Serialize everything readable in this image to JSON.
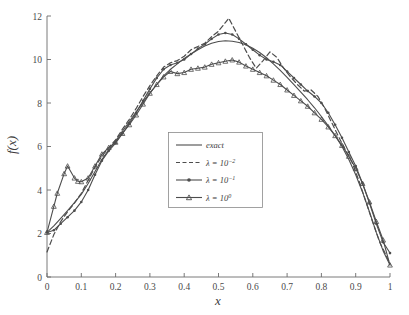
{
  "figure": {
    "background": "#ffffff",
    "axis_color": "#6b6b6b",
    "curve_color": "#4d4d4d"
  },
  "chart_data": {
    "type": "line",
    "title": "",
    "xlabel": "x",
    "ylabel": "f(x)",
    "xlim": [
      0,
      1
    ],
    "ylim": [
      0,
      12
    ],
    "grid": false,
    "legend_position": "center",
    "xticks": [
      "0",
      "0.1",
      "0.2",
      "0.3",
      "0.4",
      "0.5",
      "0.6",
      "0.7",
      "0.8",
      "0.9",
      "1"
    ],
    "xtick_values": [
      0,
      0.1,
      0.2,
      0.3,
      0.4,
      0.5,
      0.6,
      0.7,
      0.8,
      0.9,
      1
    ],
    "yticks": [
      "0",
      "2",
      "4",
      "6",
      "8",
      "10",
      "12"
    ],
    "ytick_values": [
      0,
      2,
      4,
      6,
      8,
      10,
      12
    ],
    "legend": [
      {
        "label": "exact",
        "style": "solid",
        "marker": "none"
      },
      {
        "label": "λ = 10",
        "exponent": "−2",
        "style": "dashed",
        "marker": "none"
      },
      {
        "label": "λ = 10",
        "exponent": "−1",
        "style": "solid",
        "marker": "dot"
      },
      {
        "label": "λ = 10",
        "exponent": "0",
        "style": "solid",
        "marker": "triangle"
      }
    ],
    "series": [
      {
        "name": "exact",
        "style": "solid",
        "marker": "none",
        "x": [
          0.0,
          0.02,
          0.04,
          0.06,
          0.08,
          0.1,
          0.12,
          0.14,
          0.16,
          0.18,
          0.2,
          0.22,
          0.24,
          0.26,
          0.28,
          0.3,
          0.32,
          0.34,
          0.36,
          0.38,
          0.4,
          0.42,
          0.44,
          0.46,
          0.48,
          0.5,
          0.52,
          0.54,
          0.56,
          0.58,
          0.6,
          0.62,
          0.64,
          0.66,
          0.68,
          0.7,
          0.72,
          0.74,
          0.76,
          0.78,
          0.8,
          0.82,
          0.84,
          0.86,
          0.88,
          0.9,
          0.92,
          0.94,
          0.96,
          0.98,
          1.0
        ],
        "y": [
          2.05,
          2.35,
          2.7,
          3.05,
          3.42,
          3.8,
          4.3,
          4.85,
          5.4,
          5.85,
          6.25,
          6.7,
          7.15,
          7.6,
          8.05,
          8.45,
          8.85,
          9.25,
          9.55,
          9.8,
          10.05,
          10.25,
          10.45,
          10.62,
          10.75,
          10.83,
          10.86,
          10.84,
          10.78,
          10.68,
          10.52,
          10.32,
          10.08,
          9.8,
          9.5,
          9.18,
          8.85,
          8.5,
          8.15,
          7.78,
          7.38,
          6.95,
          6.5,
          6.0,
          5.4,
          4.7,
          3.9,
          3.0,
          2.05,
          1.2,
          0.55
        ]
      },
      {
        "name": "lambda_1e-2",
        "style": "dashed",
        "marker": "none",
        "x": [
          0.0,
          0.02,
          0.04,
          0.06,
          0.08,
          0.1,
          0.12,
          0.14,
          0.16,
          0.18,
          0.2,
          0.22,
          0.24,
          0.26,
          0.28,
          0.3,
          0.32,
          0.34,
          0.36,
          0.38,
          0.4,
          0.42,
          0.44,
          0.46,
          0.48,
          0.5,
          0.52,
          0.53,
          0.55,
          0.57,
          0.59,
          0.61,
          0.63,
          0.65,
          0.67,
          0.69,
          0.71,
          0.73,
          0.75,
          0.77,
          0.79,
          0.81,
          0.83,
          0.85,
          0.87,
          0.89,
          0.91,
          0.93,
          0.95,
          0.97,
          0.99,
          1.0
        ],
        "y": [
          1.15,
          1.95,
          2.55,
          3.0,
          3.4,
          3.85,
          4.45,
          5.05,
          5.55,
          5.95,
          6.3,
          6.8,
          7.25,
          7.75,
          8.3,
          8.8,
          9.25,
          9.65,
          9.85,
          9.95,
          10.15,
          10.45,
          10.6,
          10.75,
          11.05,
          11.3,
          11.7,
          11.9,
          11.3,
          10.7,
          10.1,
          9.6,
          9.95,
          10.35,
          10.1,
          9.6,
          9.2,
          8.85,
          8.55,
          8.6,
          8.3,
          7.75,
          7.1,
          6.45,
          5.85,
          5.25,
          4.4,
          3.45,
          2.5,
          1.6,
          0.95,
          0.6
        ]
      },
      {
        "name": "lambda_1e-1",
        "style": "solid",
        "marker": "dot",
        "x": [
          0.0,
          0.02,
          0.04,
          0.06,
          0.08,
          0.1,
          0.12,
          0.14,
          0.16,
          0.18,
          0.2,
          0.22,
          0.24,
          0.26,
          0.28,
          0.3,
          0.32,
          0.34,
          0.36,
          0.38,
          0.4,
          0.42,
          0.44,
          0.46,
          0.48,
          0.5,
          0.52,
          0.54,
          0.56,
          0.58,
          0.6,
          0.62,
          0.64,
          0.66,
          0.68,
          0.7,
          0.72,
          0.74,
          0.76,
          0.78,
          0.8,
          0.82,
          0.84,
          0.86,
          0.88,
          0.9,
          0.92,
          0.94,
          0.96,
          0.98,
          1.0
        ],
        "y": [
          2.05,
          2.15,
          2.45,
          2.75,
          3.05,
          3.45,
          4.0,
          4.7,
          5.35,
          5.8,
          6.15,
          6.6,
          7.05,
          7.55,
          8.1,
          8.65,
          9.15,
          9.55,
          9.75,
          9.85,
          10.0,
          10.25,
          10.5,
          10.7,
          10.95,
          11.15,
          11.22,
          11.15,
          10.95,
          10.7,
          10.45,
          10.2,
          10.0,
          9.9,
          9.75,
          9.45,
          9.15,
          8.85,
          8.55,
          8.3,
          8.0,
          7.55,
          7.0,
          6.4,
          5.75,
          5.1,
          4.3,
          3.4,
          2.45,
          1.6,
          1.1
        ]
      },
      {
        "name": "lambda_1e0",
        "style": "solid",
        "marker": "triangle",
        "x": [
          0.0,
          0.02,
          0.03,
          0.05,
          0.06,
          0.08,
          0.09,
          0.1,
          0.12,
          0.14,
          0.16,
          0.18,
          0.2,
          0.22,
          0.24,
          0.26,
          0.28,
          0.3,
          0.32,
          0.34,
          0.36,
          0.38,
          0.4,
          0.42,
          0.44,
          0.46,
          0.48,
          0.5,
          0.52,
          0.54,
          0.56,
          0.58,
          0.6,
          0.62,
          0.64,
          0.66,
          0.68,
          0.7,
          0.72,
          0.74,
          0.76,
          0.78,
          0.8,
          0.82,
          0.84,
          0.86,
          0.88,
          0.9,
          0.92,
          0.94,
          0.96,
          0.98,
          1.0
        ],
        "y": [
          2.05,
          3.25,
          3.85,
          4.75,
          5.1,
          4.55,
          4.4,
          4.38,
          4.55,
          5.1,
          5.65,
          5.95,
          6.2,
          6.6,
          7.0,
          7.45,
          7.95,
          8.45,
          8.85,
          9.2,
          9.45,
          9.35,
          9.4,
          9.55,
          9.6,
          9.65,
          9.78,
          9.85,
          9.92,
          9.98,
          9.88,
          9.7,
          9.55,
          9.4,
          9.25,
          9.05,
          8.85,
          8.6,
          8.35,
          8.1,
          7.85,
          7.55,
          7.25,
          6.9,
          6.5,
          6.05,
          5.55,
          5.0,
          4.3,
          3.45,
          2.55,
          1.7,
          0.55
        ]
      }
    ]
  }
}
